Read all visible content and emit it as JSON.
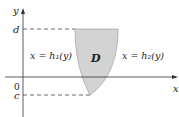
{
  "diagram": {
    "axis_x_label": "x",
    "axis_y_label": "y",
    "origin_label": "0",
    "top_bound_label": "d",
    "bottom_bound_label": "c",
    "region_label": "D",
    "left_curve_label": "x = h₁(y)",
    "right_curve_label": "x = h₂(y)",
    "colors": {
      "region_fill": "#d3d3d3",
      "region_stroke": "#a8a8a8",
      "axis": "#333333",
      "dash": "#444444"
    }
  }
}
